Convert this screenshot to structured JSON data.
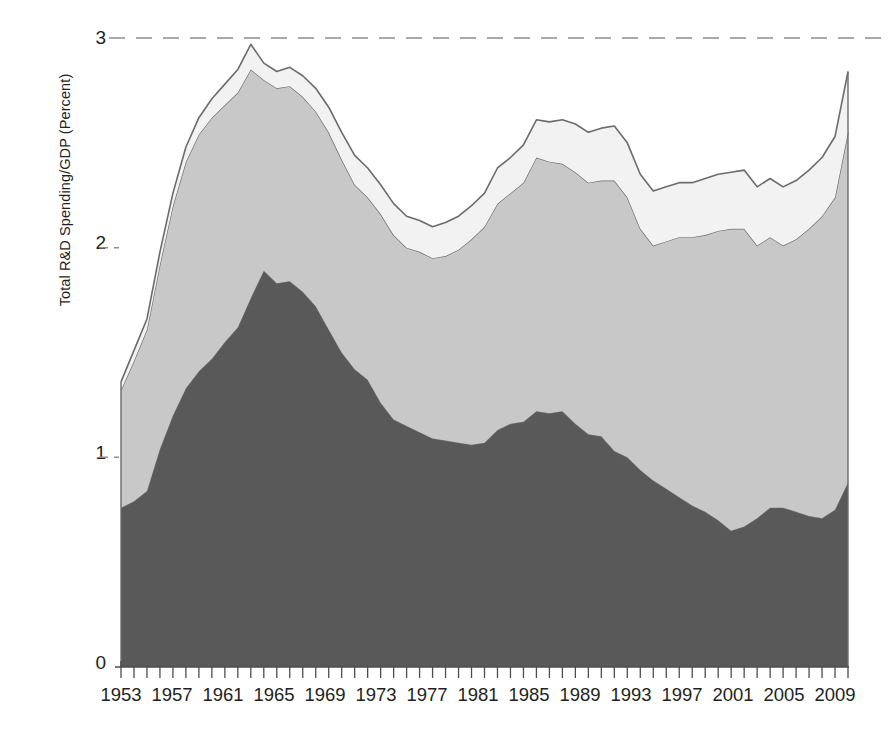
{
  "chart_data": {
    "type": "area",
    "stacked": true,
    "title": "",
    "subtitle": "",
    "xlabel": "",
    "ylabel": "Total R&D Spending/GDP (Percent)",
    "xlim": [
      1953,
      2009
    ],
    "ylim": [
      0,
      3
    ],
    "yticks": [
      "0",
      "1",
      "2",
      "3"
    ],
    "ytick_values": [
      0,
      1,
      2,
      3
    ],
    "grid": "dashed horizontal gridline at y=3 only",
    "legend": "none",
    "legend_position": "none",
    "x_tick_interval_years": 1,
    "x_label_interval_years": 4,
    "xticks": [
      "1953",
      "1957",
      "1961",
      "1965",
      "1969",
      "1973",
      "1977",
      "1981",
      "1985",
      "1989",
      "1993",
      "1997",
      "2001",
      "2005",
      "2009"
    ],
    "x": [
      1953,
      1954,
      1955,
      1956,
      1957,
      1958,
      1959,
      1960,
      1961,
      1962,
      1963,
      1964,
      1965,
      1966,
      1967,
      1968,
      1969,
      1970,
      1971,
      1972,
      1973,
      1974,
      1975,
      1976,
      1977,
      1978,
      1979,
      1980,
      1981,
      1982,
      1983,
      1984,
      1985,
      1986,
      1987,
      1988,
      1989,
      1990,
      1991,
      1992,
      1993,
      1994,
      1995,
      1996,
      1997,
      1998,
      1999,
      2000,
      2001,
      2002,
      2003,
      2004,
      2005,
      2006,
      2007,
      2008,
      2009
    ],
    "series": [
      {
        "name": "federal",
        "color": "#595959",
        "values": [
          0.76,
          0.79,
          0.84,
          1.04,
          1.2,
          1.33,
          1.41,
          1.47,
          1.55,
          1.62,
          1.76,
          1.89,
          1.83,
          1.84,
          1.79,
          1.72,
          1.61,
          1.5,
          1.42,
          1.37,
          1.26,
          1.18,
          1.15,
          1.12,
          1.09,
          1.08,
          1.07,
          1.06,
          1.07,
          1.13,
          1.16,
          1.17,
          1.22,
          1.21,
          1.22,
          1.16,
          1.11,
          1.1,
          1.03,
          1.0,
          0.94,
          0.89,
          0.85,
          0.81,
          0.77,
          0.74,
          0.7,
          0.65,
          0.67,
          0.71,
          0.76,
          0.76,
          0.74,
          0.72,
          0.71,
          0.75,
          0.88
        ]
      },
      {
        "name": "industry",
        "color": "#c8c8c8",
        "values": [
          0.56,
          0.67,
          0.77,
          0.88,
          1.0,
          1.08,
          1.13,
          1.15,
          1.13,
          1.12,
          1.09,
          0.91,
          0.93,
          0.93,
          0.93,
          0.93,
          0.94,
          0.92,
          0.88,
          0.87,
          0.9,
          0.88,
          0.85,
          0.86,
          0.86,
          0.88,
          0.92,
          0.98,
          1.03,
          1.08,
          1.1,
          1.14,
          1.21,
          1.2,
          1.18,
          1.2,
          1.2,
          1.22,
          1.29,
          1.24,
          1.15,
          1.12,
          1.18,
          1.24,
          1.28,
          1.32,
          1.38,
          1.44,
          1.42,
          1.3,
          1.29,
          1.25,
          1.3,
          1.37,
          1.44,
          1.49,
          1.67
        ]
      },
      {
        "name": "other",
        "color": "#f2f2f2",
        "values": [
          0.04,
          0.05,
          0.05,
          0.06,
          0.06,
          0.07,
          0.08,
          0.09,
          0.1,
          0.11,
          0.12,
          0.08,
          0.08,
          0.09,
          0.1,
          0.11,
          0.12,
          0.13,
          0.14,
          0.14,
          0.14,
          0.15,
          0.15,
          0.15,
          0.15,
          0.16,
          0.16,
          0.16,
          0.16,
          0.17,
          0.17,
          0.18,
          0.18,
          0.19,
          0.21,
          0.23,
          0.24,
          0.25,
          0.26,
          0.26,
          0.26,
          0.26,
          0.26,
          0.26,
          0.26,
          0.27,
          0.27,
          0.27,
          0.28,
          0.28,
          0.28,
          0.28,
          0.28,
          0.28,
          0.28,
          0.29,
          0.29
        ]
      }
    ],
    "totals": [
      1.36,
      1.51,
      1.66,
      1.98,
      2.26,
      2.48,
      2.62,
      2.71,
      2.78,
      2.85,
      2.97,
      2.88,
      2.84,
      2.86,
      2.82,
      2.76,
      2.67,
      2.55,
      2.44,
      2.38,
      2.3,
      2.21,
      2.15,
      2.13,
      2.1,
      2.12,
      2.15,
      2.2,
      2.26,
      2.38,
      2.43,
      2.49,
      2.61,
      2.6,
      2.61,
      2.59,
      2.55,
      2.57,
      2.58,
      2.5,
      2.35,
      2.27,
      2.29,
      2.31,
      2.31,
      2.33,
      2.35,
      2.36,
      2.37,
      2.29,
      2.33,
      2.29,
      2.32,
      2.37,
      2.43,
      2.53,
      2.84
    ]
  },
  "axis": {
    "ylabel_text": "Total R&D Spending/GDP (Percent)",
    "ytick_0": "0",
    "ytick_1": "1",
    "ytick_2": "2",
    "ytick_3": "3",
    "xtick_0": "1953",
    "xtick_1": "1957",
    "xtick_2": "1961",
    "xtick_3": "1965",
    "xtick_4": "1969",
    "xtick_5": "1973",
    "xtick_6": "1977",
    "xtick_7": "1981",
    "xtick_8": "1985",
    "xtick_9": "1989",
    "xtick_10": "1993",
    "xtick_11": "1997",
    "xtick_12": "2001",
    "xtick_13": "2005",
    "xtick_14": "2009"
  },
  "colors": {
    "band_bottom": "#595959",
    "band_middle": "#c8c8c8",
    "band_top": "#f2f2f2",
    "outline": "#6b6b6b",
    "gridline": "#8d8d8d",
    "axis": "#4d4d4d",
    "text": "#231f20"
  }
}
